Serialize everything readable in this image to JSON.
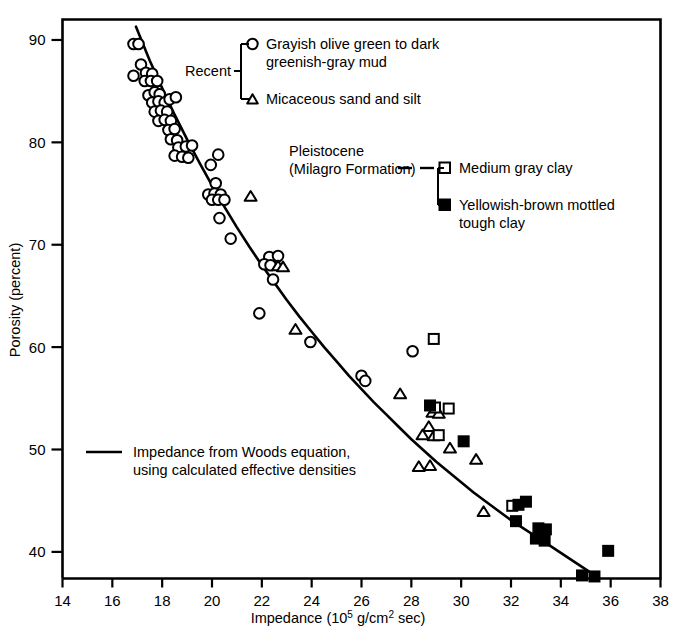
{
  "figure": {
    "title": "",
    "background": "#ffffff",
    "foreground": "#000000"
  },
  "axes": {
    "x": {
      "label_prefix": "Impedance (10",
      "label_exponent": "5",
      "label_mid": " g/cm",
      "label_exponent2": "2",
      "label_suffix": " sec)",
      "label_full": "Impedance (10^5 g/cm^2 sec)",
      "ticks": [
        "14",
        "16",
        "18",
        "20",
        "22",
        "24",
        "26",
        "28",
        "30",
        "32",
        "34",
        "36",
        "38"
      ],
      "min": 14,
      "max": 38,
      "step": 2
    },
    "y": {
      "label": "Porosity (percent)",
      "ticks": [
        "40",
        "50",
        "60",
        "70",
        "80",
        "90"
      ],
      "min": 37.4,
      "max": 92.0,
      "tick_min": 40,
      "tick_max": 90,
      "step": 10
    }
  },
  "legend": {
    "group_recent": {
      "bracket_label": "Recent",
      "entries": [
        {
          "marker": "open-circle",
          "line1": "Grayish olive green to dark",
          "line2": "greenish-gray mud"
        },
        {
          "marker": "open-triangle",
          "line1": "Micaceous sand and silt",
          "line2": ""
        }
      ]
    },
    "group_pleistocene": {
      "bracket_label_line1": "Pleistocene",
      "bracket_label_line2": "(Milagro Formation)",
      "entries": [
        {
          "marker": "open-square",
          "line1": "Medium gray clay",
          "line2": ""
        },
        {
          "marker": "filled-square",
          "line1": "Yellowish-brown mottled",
          "line2": "tough clay"
        }
      ]
    },
    "curve_note": {
      "marker": "line-segment",
      "line1": "Impedance from Woods equation,",
      "line2": "using calculated effective densities"
    }
  },
  "chart_data": {
    "type": "scatter",
    "title": "",
    "xlabel": "Impedance (10^5 g/cm^2 sec)",
    "ylabel": "Porosity (percent)",
    "xlim": [
      14,
      38
    ],
    "ylim": [
      37.4,
      92.0
    ],
    "grid": false,
    "legend_position": "inside-top-right",
    "series": [
      {
        "name": "Grayish olive green to dark greenish-gray mud",
        "marker": "open-circle",
        "geologic_unit": "Recent",
        "points": [
          [
            16.85,
            89.6
          ],
          [
            17.05,
            89.6
          ],
          [
            17.15,
            87.6
          ],
          [
            16.85,
            86.5
          ],
          [
            17.35,
            86.8
          ],
          [
            17.6,
            86.7
          ],
          [
            17.3,
            86.0
          ],
          [
            17.55,
            86.0
          ],
          [
            17.8,
            86.0
          ],
          [
            17.45,
            84.6
          ],
          [
            17.7,
            84.9
          ],
          [
            17.9,
            84.7
          ],
          [
            17.6,
            83.9
          ],
          [
            17.85,
            84.0
          ],
          [
            18.1,
            83.9
          ],
          [
            18.3,
            84.2
          ],
          [
            18.55,
            84.4
          ],
          [
            17.7,
            83.0
          ],
          [
            17.95,
            83.1
          ],
          [
            18.2,
            83.0
          ],
          [
            17.85,
            82.1
          ],
          [
            18.1,
            82.2
          ],
          [
            18.35,
            82.1
          ],
          [
            18.25,
            81.2
          ],
          [
            18.5,
            81.3
          ],
          [
            18.35,
            80.3
          ],
          [
            18.6,
            80.2
          ],
          [
            18.65,
            79.5
          ],
          [
            18.95,
            79.6
          ],
          [
            19.2,
            79.7
          ],
          [
            18.5,
            78.7
          ],
          [
            18.8,
            78.6
          ],
          [
            19.05,
            78.5
          ],
          [
            20.25,
            78.8
          ],
          [
            19.95,
            77.8
          ],
          [
            20.15,
            76.0
          ],
          [
            19.85,
            74.9
          ],
          [
            20.1,
            75.0
          ],
          [
            20.35,
            74.9
          ],
          [
            20.0,
            74.4
          ],
          [
            20.25,
            74.4
          ],
          [
            20.5,
            74.4
          ],
          [
            20.3,
            72.6
          ],
          [
            20.75,
            70.6
          ],
          [
            22.3,
            68.8
          ],
          [
            22.65,
            68.9
          ],
          [
            22.1,
            68.1
          ],
          [
            22.35,
            68.0
          ],
          [
            22.45,
            66.6
          ],
          [
            21.9,
            63.3
          ],
          [
            23.95,
            60.5
          ],
          [
            26.0,
            57.2
          ],
          [
            26.15,
            56.7
          ],
          [
            28.05,
            59.6
          ]
        ]
      },
      {
        "name": "Micaceous sand and silt",
        "marker": "open-triangle",
        "geologic_unit": "Recent",
        "points": [
          [
            21.55,
            74.7
          ],
          [
            22.65,
            67.9
          ],
          [
            22.85,
            67.8
          ],
          [
            23.35,
            61.7
          ],
          [
            27.55,
            55.4
          ],
          [
            28.85,
            53.6
          ],
          [
            29.1,
            53.5
          ],
          [
            28.7,
            52.2
          ],
          [
            28.45,
            51.4
          ],
          [
            28.9,
            51.3
          ],
          [
            29.55,
            50.1
          ],
          [
            30.6,
            49.0
          ],
          [
            28.3,
            48.3
          ],
          [
            28.75,
            48.4
          ],
          [
            30.9,
            43.9
          ]
        ]
      },
      {
        "name": "Medium gray clay",
        "marker": "open-square",
        "geologic_unit": "Pleistocene (Milagro Formation)",
        "points": [
          [
            28.9,
            60.8
          ],
          [
            28.95,
            54.1
          ],
          [
            29.5,
            54.0
          ],
          [
            29.1,
            51.4
          ],
          [
            32.05,
            44.5
          ]
        ]
      },
      {
        "name": "Yellowish-brown mottled tough clay",
        "marker": "filled-square",
        "geologic_unit": "Pleistocene (Milagro Formation)",
        "points": [
          [
            28.75,
            54.3
          ],
          [
            30.1,
            50.8
          ],
          [
            32.3,
            44.6
          ],
          [
            32.6,
            44.9
          ],
          [
            32.2,
            43.0
          ],
          [
            33.1,
            42.3
          ],
          [
            33.4,
            42.2
          ],
          [
            33.0,
            41.3
          ],
          [
            33.35,
            41.1
          ],
          [
            35.9,
            40.1
          ],
          [
            34.85,
            37.7
          ],
          [
            35.35,
            37.6
          ]
        ]
      }
    ],
    "curve": {
      "name": "Impedance from Woods equation, using calculated effective densities",
      "style": "solid-line",
      "points": [
        [
          16.95,
          91.3
        ],
        [
          17.5,
          88.0
        ],
        [
          18.0,
          85.3
        ],
        [
          18.5,
          82.7
        ],
        [
          19.0,
          80.3
        ],
        [
          19.5,
          78.0
        ],
        [
          20.0,
          75.8
        ],
        [
          20.5,
          73.7
        ],
        [
          21.0,
          71.7
        ],
        [
          21.5,
          69.8
        ],
        [
          22.0,
          68.0
        ],
        [
          22.5,
          66.3
        ],
        [
          23.0,
          64.6
        ],
        [
          23.5,
          63.0
        ],
        [
          24.0,
          61.5
        ],
        [
          24.5,
          60.0
        ],
        [
          25.0,
          58.6
        ],
        [
          25.5,
          57.2
        ],
        [
          26.0,
          55.9
        ],
        [
          26.5,
          54.6
        ],
        [
          27.0,
          53.4
        ],
        [
          27.5,
          52.2
        ],
        [
          28.0,
          51.0
        ],
        [
          28.5,
          49.9
        ],
        [
          29.0,
          48.8
        ],
        [
          29.5,
          47.8
        ],
        [
          30.0,
          46.8
        ],
        [
          30.5,
          45.8
        ],
        [
          31.0,
          44.9
        ],
        [
          31.5,
          44.0
        ],
        [
          32.0,
          43.1
        ],
        [
          32.5,
          42.3
        ],
        [
          33.0,
          41.5
        ],
        [
          33.5,
          40.7
        ],
        [
          34.0,
          39.9
        ],
        [
          34.5,
          39.1
        ],
        [
          35.0,
          38.3
        ],
        [
          35.3,
          37.8
        ]
      ]
    }
  }
}
